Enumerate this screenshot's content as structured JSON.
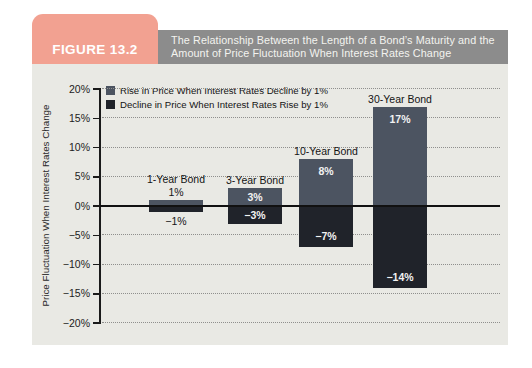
{
  "figure": {
    "label": "FIGURE 13.2",
    "title_line1": "The Relationship Between the Length of a Bond’s Maturity and the",
    "title_line2": "Amount of Price Fluctuation When Interest Rates Change"
  },
  "colors": {
    "tab": "#f2a191",
    "title_bar": "#8c8c8c",
    "figure_bg": "#e9e9e4",
    "rise_bar": "#4c5461",
    "decline_bar": "#20232a",
    "axis": "#1a1a1a"
  },
  "chart_data": {
    "type": "bar",
    "title": "The Relationship Between the Length of a Bond’s Maturity and the Amount of Price Fluctuation When Interest Rates Change",
    "categories": [
      "1-Year Bond",
      "3-Year Bond",
      "10-Year Bond",
      "30-Year Bond"
    ],
    "series": [
      {
        "name": "Rise in Price When Interest Rates Decline by 1%",
        "values": [
          1,
          3,
          8,
          17
        ]
      },
      {
        "name": "Decline in Price When Interest Rates Rise by 1%",
        "values": [
          -1,
          -3,
          -7,
          -14
        ]
      }
    ],
    "bar_value_labels": {
      "rise": [
        "1%",
        "3%",
        "8%",
        "17%"
      ],
      "decline": [
        "−1%",
        "−3%",
        "−7%",
        "−14%"
      ]
    },
    "xlabel": "",
    "ylabel": "Price Fluctuation When Interest Rates Change",
    "ylim": [
      -20,
      20
    ],
    "ytick_step": 5,
    "ytick_labels": [
      "20%",
      "15%",
      "10%",
      "5%",
      "0%",
      "−5%",
      "−10%",
      "−15%",
      "−20%"
    ],
    "grid": "dotted-horizontal",
    "legend_position": "top-left-inside"
  }
}
